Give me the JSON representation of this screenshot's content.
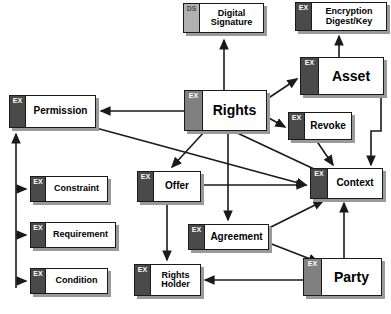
{
  "diagram": {
    "colors": {
      "tab_dark": "#4a4a4a",
      "tab_mid": "#808080",
      "tab_light": "#b0b0b0",
      "box_fill": "#ffffff",
      "outline": "#1a1a1a",
      "shadow": "#9a9a9a",
      "background": "#ffffff"
    },
    "nodes": [
      {
        "id": "digital_signature",
        "tag": "DS",
        "label": "Digital\nSignature",
        "line1": "Digital",
        "line2": "Signature",
        "x": 183,
        "y": 3,
        "w": 81,
        "h": 30,
        "tab_w": 15,
        "tab_style": "tab-light",
        "size": "sz-sm"
      },
      {
        "id": "encryption",
        "tag": "EX",
        "label": "Encryption\nDigest/Key",
        "line1": "Encryption",
        "line2": "Digest/Key",
        "x": 295,
        "y": 2,
        "w": 92,
        "h": 29,
        "tab_w": 15,
        "tab_style": "tab-dark",
        "size": "sz-sm"
      },
      {
        "id": "asset",
        "tag": "EX",
        "label": "Asset",
        "line1": "Asset",
        "line2": "",
        "x": 300,
        "y": 57,
        "w": 84,
        "h": 38,
        "tab_w": 17,
        "tab_style": "tab-dark",
        "size": "sz-xl"
      },
      {
        "id": "rights",
        "tag": "EX",
        "label": "Rights",
        "line1": "Rights",
        "line2": "",
        "x": 184,
        "y": 90,
        "w": 83,
        "h": 41,
        "tab_w": 17,
        "tab_style": "tab-mid",
        "size": "sz-xl"
      },
      {
        "id": "permission",
        "tag": "EX",
        "label": "Permission",
        "line1": "Permission",
        "line2": "",
        "x": 9,
        "y": 95,
        "w": 87,
        "h": 33,
        "tab_w": 15,
        "tab_style": "tab-dark",
        "size": "sz-md"
      },
      {
        "id": "revoke",
        "tag": "EX",
        "label": "Revoke",
        "line1": "Revoke",
        "line2": "",
        "x": 288,
        "y": 112,
        "w": 64,
        "h": 28,
        "tab_w": 15,
        "tab_style": "tab-dark",
        "size": "sz-md"
      },
      {
        "id": "context",
        "tag": "EX",
        "label": "Context",
        "line1": "Context",
        "line2": "",
        "x": 310,
        "y": 168,
        "w": 73,
        "h": 31,
        "tab_w": 16,
        "tab_style": "tab-dark",
        "size": "sz-md"
      },
      {
        "id": "offer",
        "tag": "EX",
        "label": "Offer",
        "line1": "Offer",
        "line2": "",
        "x": 137,
        "y": 171,
        "w": 64,
        "h": 31,
        "tab_w": 15,
        "tab_style": "tab-dark",
        "size": "sz-md"
      },
      {
        "id": "constraint",
        "tag": "EX",
        "label": "Constraint",
        "line1": "Constraint",
        "line2": "",
        "x": 30,
        "y": 176,
        "w": 78,
        "h": 26,
        "tab_w": 14,
        "tab_style": "tab-dark",
        "size": "sz-sm"
      },
      {
        "id": "requirement",
        "tag": "EX",
        "label": "Requirement",
        "line1": "Requirement",
        "line2": "",
        "x": 30,
        "y": 222,
        "w": 86,
        "h": 26,
        "tab_w": 14,
        "tab_style": "tab-dark",
        "size": "sz-sm"
      },
      {
        "id": "agreement",
        "tag": "EX",
        "label": "Agreement",
        "line1": "Agreement",
        "line2": "",
        "x": 188,
        "y": 224,
        "w": 81,
        "h": 26,
        "tab_w": 15,
        "tab_style": "tab-dark",
        "size": "sz-md"
      },
      {
        "id": "condition",
        "tag": "EX",
        "label": "Condition",
        "line1": "Condition",
        "line2": "",
        "x": 30,
        "y": 268,
        "w": 78,
        "h": 26,
        "tab_w": 14,
        "tab_style": "tab-dark",
        "size": "sz-sm"
      },
      {
        "id": "rights_holder",
        "tag": "EX",
        "label": "Rights\nHolder",
        "line1": "Rights",
        "line2": "Holder",
        "x": 134,
        "y": 264,
        "w": 67,
        "h": 32,
        "tab_w": 15,
        "tab_style": "tab-dark",
        "size": "sz-sm"
      },
      {
        "id": "party",
        "tag": "EX",
        "label": "Party",
        "line1": "Party",
        "line2": "",
        "x": 303,
        "y": 258,
        "w": 79,
        "h": 38,
        "tab_w": 17,
        "tab_style": "tab-mid",
        "size": "sz-xl"
      }
    ],
    "edges": [
      {
        "id": "rights-to-digital-signature",
        "from": "rights",
        "to": "digital_signature",
        "path": "M 224,90 L 224,40"
      },
      {
        "id": "asset-to-encryption",
        "from": "asset",
        "to": "encryption",
        "path": "M 339,57 L 339,36"
      },
      {
        "id": "rights-to-asset",
        "from": "rights",
        "to": "asset",
        "path": "M 267,99 L 297,79"
      },
      {
        "id": "rights-to-permission",
        "from": "rights",
        "to": "permission",
        "path": "M 184,111 L 101,111"
      },
      {
        "id": "rights-to-revoke",
        "from": "rights",
        "to": "revoke",
        "path": "M 267,117 L 285,127"
      },
      {
        "id": "rights-to-offer",
        "from": "rights",
        "to": "offer",
        "path": "M 205,131 L 172,167"
      },
      {
        "id": "rights-to-agreement",
        "from": "rights",
        "to": "agreement",
        "path": "M 228,131 L 228,220"
      },
      {
        "id": "rights-to-context",
        "from": "rights",
        "to": "context",
        "path": "M 233,131 L 329,176"
      },
      {
        "id": "permission-to-context",
        "from": "permission",
        "to": "context",
        "path": "M 96,128 L 306,185"
      },
      {
        "id": "revoke-to-context",
        "from": "revoke",
        "to": "context",
        "path": "M 316,140 L 333,165"
      },
      {
        "id": "asset-to-context",
        "from": "asset",
        "to": "context",
        "path": "M 381,95 L 381,131 L 371,131 L 371,165"
      },
      {
        "id": "offer-to-context",
        "from": "offer",
        "to": "context",
        "path": "M 201,185 L 306,185"
      },
      {
        "id": "offer-to-rights-holder",
        "from": "offer",
        "to": "rights_holder",
        "path": "M 167,202 L 167,260"
      },
      {
        "id": "agreement-to-context",
        "from": "agreement",
        "to": "context",
        "path": "M 269,228 L 323,201"
      },
      {
        "id": "agreement-to-party",
        "from": "agreement",
        "to": "party",
        "path": "M 269,243 L 318,262"
      },
      {
        "id": "party-to-context",
        "from": "party",
        "to": "context",
        "path": "M 344,258 L 344,203"
      },
      {
        "id": "party-to-rights-holder",
        "from": "party",
        "to": "rights_holder",
        "path": "M 303,280 L 205,280"
      },
      {
        "id": "permission-bus-to-permission",
        "from": "bus",
        "to": "permission",
        "path": "M 16,288 L 16,134"
      },
      {
        "id": "bus-to-constraint",
        "from": "bus",
        "to": "constraint",
        "path": "M 16,189 L 26,189"
      },
      {
        "id": "bus-to-requirement",
        "from": "bus",
        "to": "requirement",
        "path": "M 16,235 L 26,235"
      },
      {
        "id": "bus-to-condition",
        "from": "bus",
        "to": "condition",
        "path": "M 16,281 L 26,281"
      }
    ]
  }
}
